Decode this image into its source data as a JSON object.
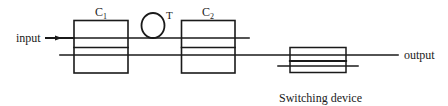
{
  "diagram": {
    "labels": {
      "input": "input",
      "output": "output",
      "coupler1": "C",
      "coupler1_sub": "1",
      "coupler2": "C",
      "coupler2_sub": "2",
      "loop": "T",
      "switching_device": "Switching device"
    },
    "components": [
      {
        "id": "C1",
        "type": "coupler",
        "label": "C1"
      },
      {
        "id": "T",
        "type": "fiber-loop",
        "label": "T"
      },
      {
        "id": "C2",
        "type": "coupler",
        "label": "C2"
      },
      {
        "id": "SW",
        "type": "switching-device",
        "label": "Switching device"
      }
    ],
    "connections": [
      {
        "from": "input",
        "to": "C1"
      },
      {
        "from": "C1",
        "to": "T"
      },
      {
        "from": "T",
        "to": "C2"
      },
      {
        "from": "C1",
        "to": "C2"
      },
      {
        "from": "C2",
        "to": "SW"
      },
      {
        "from": "SW",
        "to": "output"
      }
    ],
    "colors": {
      "stroke": "#1a1a1a",
      "background": "#ffffff"
    }
  }
}
